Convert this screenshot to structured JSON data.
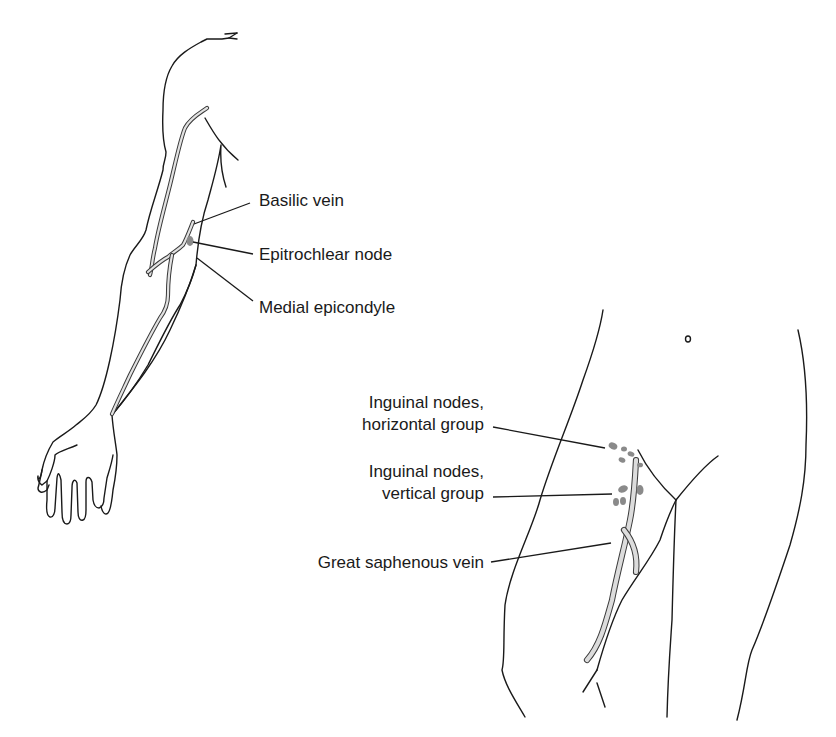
{
  "figure": {
    "panels": [
      {
        "id": "upper-limb",
        "subject": "Right arm, anterior view",
        "labels": [
          {
            "key": "basilic_vein",
            "text": "Basilic vein"
          },
          {
            "key": "epitrochlear_node",
            "text": "Epitrochlear node"
          },
          {
            "key": "medial_epicondyle",
            "text": "Medial epicondyle"
          }
        ]
      },
      {
        "id": "lower-limb",
        "subject": "Inguinal region and thigh, anterior view",
        "labels": [
          {
            "key": "inguinal_horizontal_line1",
            "text": "Inguinal nodes,"
          },
          {
            "key": "inguinal_horizontal_line2",
            "text": "horizontal group"
          },
          {
            "key": "inguinal_vertical_line1",
            "text": "Inguinal nodes,"
          },
          {
            "key": "inguinal_vertical_line2",
            "text": "vertical group"
          },
          {
            "key": "great_saphenous_vein",
            "text": "Great saphenous vein"
          }
        ]
      }
    ],
    "colors": {
      "outline": "#1a1a1a",
      "vein_fill": "#e2e2e2",
      "node_fill": "#8a8a8a",
      "background": "#ffffff"
    }
  }
}
